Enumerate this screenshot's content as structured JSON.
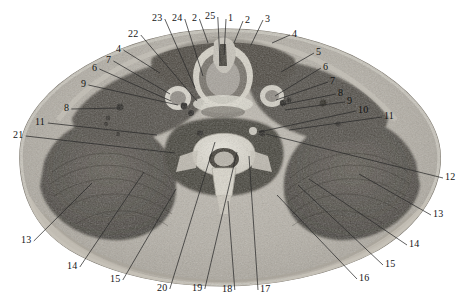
{
  "figure": {
    "type": "anatomical-cross-section",
    "modality": "axial section photograph (cadaveric / CT-like grayscale)",
    "region": "root of the neck / upper thorax, axial plane",
    "width": 461,
    "height": 300,
    "background_color": "#ffffff",
    "tissue_palette": {
      "skin_fat": "#b8b3aa",
      "muscle_dark": "#4a4640",
      "muscle_mid": "#6d675f",
      "bone_bright": "#e6e2d8",
      "cord_gray": "#9a948b",
      "outline": "#8d887f"
    },
    "leader_line_color": "#2b2b2b",
    "label_text_color": "#151515"
  },
  "labels": [
    {
      "id": "L23",
      "text": "23",
      "x": 152,
      "y": 13,
      "anchor_x": 195,
      "anchor_y": 88
    },
    {
      "id": "L24",
      "text": "24",
      "x": 172,
      "y": 13,
      "anchor_x": 203,
      "anchor_y": 76
    },
    {
      "id": "L2a",
      "text": "2",
      "x": 192,
      "y": 13,
      "anchor_x": 208,
      "anchor_y": 43
    },
    {
      "id": "L25",
      "text": "25",
      "x": 205,
      "y": 11,
      "anchor_x": 220,
      "anchor_y": 62
    },
    {
      "id": "L1",
      "text": "1",
      "x": 228,
      "y": 13,
      "anchor_x": 224,
      "anchor_y": 55
    },
    {
      "id": "L2b",
      "text": "2",
      "x": 245,
      "y": 15,
      "anchor_x": 234,
      "anchor_y": 43
    },
    {
      "id": "L3",
      "text": "3",
      "x": 265,
      "y": 14,
      "anchor_x": 251,
      "anchor_y": 45
    },
    {
      "id": "L4r",
      "text": "4",
      "x": 292,
      "y": 29,
      "anchor_x": 272,
      "anchor_y": 43
    },
    {
      "id": "L22",
      "text": "22",
      "x": 128,
      "y": 29,
      "anchor_x": 197,
      "anchor_y": 101
    },
    {
      "id": "L4l",
      "text": "4",
      "x": 116,
      "y": 44,
      "anchor_x": 160,
      "anchor_y": 73
    },
    {
      "id": "L7l",
      "text": "7",
      "x": 106,
      "y": 55,
      "anchor_x": 170,
      "anchor_y": 94
    },
    {
      "id": "L6l",
      "text": "6",
      "x": 92,
      "y": 63,
      "anchor_x": 171,
      "anchor_y": 101
    },
    {
      "id": "L9l",
      "text": "9",
      "x": 81,
      "y": 79,
      "anchor_x": 178,
      "anchor_y": 105
    },
    {
      "id": "L8l",
      "text": "8",
      "x": 64,
      "y": 103,
      "anchor_x": 120,
      "anchor_y": 108
    },
    {
      "id": "L11l",
      "text": "11",
      "x": 35,
      "y": 117,
      "anchor_x": 157,
      "anchor_y": 135
    },
    {
      "id": "L21",
      "text": "21",
      "x": 13,
      "y": 130,
      "anchor_x": 175,
      "anchor_y": 153
    },
    {
      "id": "L5r",
      "text": "5",
      "x": 316,
      "y": 47,
      "anchor_x": 281,
      "anchor_y": 72
    },
    {
      "id": "L6r",
      "text": "6",
      "x": 323,
      "y": 62,
      "anchor_x": 275,
      "anchor_y": 96
    },
    {
      "id": "L7r",
      "text": "7",
      "x": 330,
      "y": 76,
      "anchor_x": 276,
      "anchor_y": 100
    },
    {
      "id": "L8r",
      "text": "8",
      "x": 338,
      "y": 88,
      "anchor_x": 281,
      "anchor_y": 105
    },
    {
      "id": "L9r",
      "text": "9",
      "x": 347,
      "y": 96,
      "anchor_x": 285,
      "anchor_y": 110
    },
    {
      "id": "L10",
      "text": "10",
      "x": 358,
      "y": 105,
      "anchor_x": 259,
      "anchor_y": 132
    },
    {
      "id": "L11r",
      "text": "11",
      "x": 384,
      "y": 111,
      "anchor_x": 289,
      "anchor_y": 130
    },
    {
      "id": "L12",
      "text": "12",
      "x": 445,
      "y": 172,
      "anchor_x": 266,
      "anchor_y": 134
    },
    {
      "id": "L13r",
      "text": "13",
      "x": 433,
      "y": 209,
      "anchor_x": 359,
      "anchor_y": 174
    },
    {
      "id": "L14r",
      "text": "14",
      "x": 409,
      "y": 239,
      "anchor_x": 309,
      "anchor_y": 179
    },
    {
      "id": "L15r",
      "text": "15",
      "x": 385,
      "y": 259,
      "anchor_x": 298,
      "anchor_y": 185
    },
    {
      "id": "L16",
      "text": "16",
      "x": 359,
      "y": 273,
      "anchor_x": 277,
      "anchor_y": 195
    },
    {
      "id": "L17",
      "text": "17",
      "x": 260,
      "y": 284,
      "anchor_x": 249,
      "anchor_y": 156
    },
    {
      "id": "L18",
      "text": "18",
      "x": 222,
      "y": 284,
      "anchor_x": 228,
      "anchor_y": 201
    },
    {
      "id": "L19",
      "text": "19",
      "x": 192,
      "y": 283,
      "anchor_x": 237,
      "anchor_y": 152
    },
    {
      "id": "L20",
      "text": "20",
      "x": 157,
      "y": 283,
      "anchor_x": 215,
      "anchor_y": 142
    },
    {
      "id": "L15l",
      "text": "15",
      "x": 110,
      "y": 274,
      "anchor_x": 176,
      "anchor_y": 189
    },
    {
      "id": "L14l",
      "text": "14",
      "x": 67,
      "y": 261,
      "anchor_x": 144,
      "anchor_y": 172
    },
    {
      "id": "L13l",
      "text": "13",
      "x": 21,
      "y": 235,
      "anchor_x": 92,
      "anchor_y": 183
    }
  ]
}
